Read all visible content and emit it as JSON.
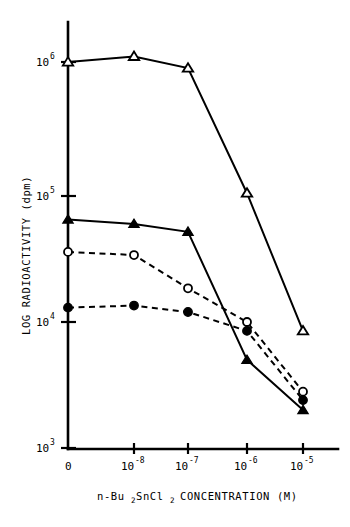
{
  "chart_data": {
    "type": "line",
    "title": "",
    "xlabel": "n-Bu2SnCl2 CONCENTRATION (M)",
    "xlabel_parts": {
      "prefix": "n-Bu",
      "sub1": "2",
      "mid": "SnCl",
      "sub2": "2",
      "suffix": "CONCENTRATION (M)"
    },
    "ylabel": "LOG RADIOACTIVITY (dpm)",
    "x_tick_labels": [
      "0",
      "10-8",
      "10-7",
      "10-6",
      "10-5"
    ],
    "x_ticks": [
      {
        "base": "0",
        "exp": ""
      },
      {
        "base": "10",
        "exp": "-8"
      },
      {
        "base": "10",
        "exp": "-7"
      },
      {
        "base": "10",
        "exp": "-6"
      },
      {
        "base": "10",
        "exp": "-5"
      }
    ],
    "x_values": [
      0,
      1e-08,
      1e-07,
      1e-06,
      1e-05
    ],
    "y_tick_labels": [
      "10^6",
      "10^5",
      "10^4",
      "10^3"
    ],
    "y_ticks": [
      {
        "base": "10",
        "exp": "6"
      },
      {
        "base": "10",
        "exp": "5"
      },
      {
        "base": "10",
        "exp": "4"
      },
      {
        "base": "10",
        "exp": "3"
      }
    ],
    "ylim": [
      1000,
      2000000
    ],
    "yscale": "log",
    "xscale": "categorical-log",
    "grid": false,
    "legend": "none",
    "series": [
      {
        "name": "open-triangle",
        "marker": "open-triangle",
        "line": "solid",
        "values": [
          1000000,
          1100000,
          900000,
          105000,
          8500
        ]
      },
      {
        "name": "filled-triangle",
        "marker": "filled-triangle",
        "line": "solid",
        "values": [
          65000,
          60000,
          52000,
          5000,
          2000
        ]
      },
      {
        "name": "open-circle",
        "marker": "open-circle",
        "line": "dashed",
        "values": [
          36000,
          34000,
          18500,
          10000,
          2800
        ]
      },
      {
        "name": "filled-circle",
        "marker": "filled-circle",
        "line": "dashed",
        "values": [
          13000,
          13500,
          12000,
          8500,
          2400
        ]
      }
    ]
  }
}
